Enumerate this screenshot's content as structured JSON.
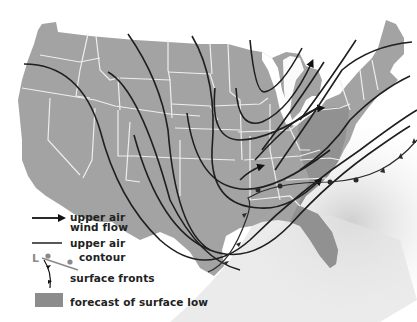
{
  "map": {
    "region": "United States",
    "colors": {
      "land": "#a3a3a3",
      "forecast_low_area": "#8c8c8c",
      "state_borders": "#e8e8e8",
      "lines": "#222222",
      "ocean_shade": "#d8d8d8",
      "background": "#ffffff"
    }
  },
  "legend": {
    "items": [
      {
        "symbol": "arrow-line",
        "label_line1": "upper air",
        "label_line2": "wind flow"
      },
      {
        "symbol": "plain-line",
        "label_line1": "upper air",
        "label_line2": "contour"
      },
      {
        "symbol": "front-line",
        "label_line1": "surface fronts"
      },
      {
        "symbol": "gray-box",
        "label_line1": "forecast of surface low"
      }
    ],
    "low_marker": "L"
  }
}
